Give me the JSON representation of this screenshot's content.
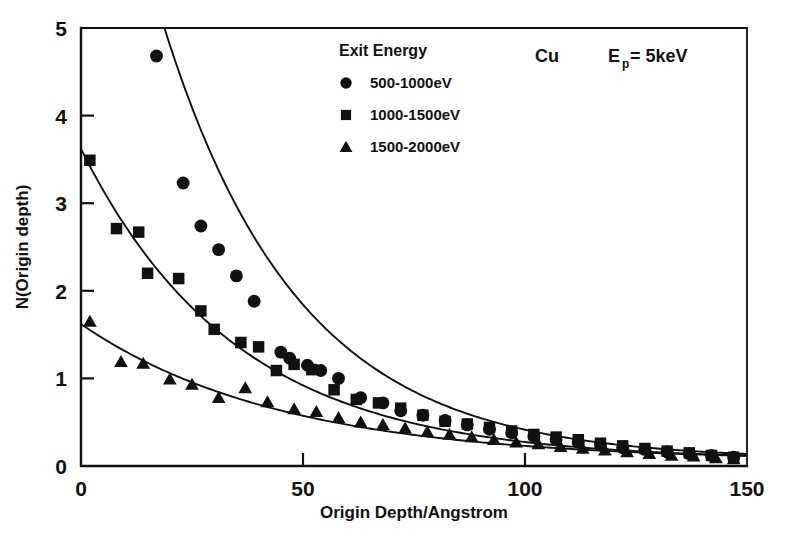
{
  "chart_data": {
    "type": "scatter",
    "title": "",
    "xlabel": "Origin Depth/Angstrom",
    "ylabel": "N(Origin depth)",
    "xlim": [
      0,
      150
    ],
    "ylim": [
      0,
      5
    ],
    "xticks": [
      0,
      50,
      100,
      150
    ],
    "yticks": [
      0,
      1,
      2,
      3,
      4,
      5
    ],
    "grid": false,
    "legend_position": "top-center",
    "legend_title": "Exit Energy",
    "annotations": [
      {
        "text": "Cu",
        "position": "top-right"
      },
      {
        "text": "E",
        "sub": "p",
        "text2": "= 5keV",
        "position": "top-right"
      }
    ],
    "series": [
      {
        "name": "500-1000eV",
        "marker": "circle",
        "points": [
          [
            17,
            4.68
          ],
          [
            23,
            3.23
          ],
          [
            27,
            2.74
          ],
          [
            31,
            2.47
          ],
          [
            35,
            2.17
          ],
          [
            39,
            1.88
          ],
          [
            45,
            1.3
          ],
          [
            47,
            1.23
          ],
          [
            51,
            1.15
          ],
          [
            54,
            1.09
          ],
          [
            58,
            1.0
          ],
          [
            63,
            0.78
          ],
          [
            68,
            0.72
          ],
          [
            72,
            0.63
          ],
          [
            77,
            0.58
          ],
          [
            82,
            0.52
          ],
          [
            87,
            0.47
          ],
          [
            92,
            0.42
          ],
          [
            97,
            0.38
          ],
          [
            102,
            0.34
          ],
          [
            107,
            0.3
          ],
          [
            112,
            0.27
          ],
          [
            117,
            0.24
          ],
          [
            122,
            0.21
          ],
          [
            127,
            0.19
          ],
          [
            132,
            0.16
          ],
          [
            137,
            0.14
          ],
          [
            142,
            0.12
          ],
          [
            147,
            0.1
          ]
        ],
        "fit": {
          "form": "exponential_decay",
          "y0": 9.2,
          "decay_length": 30.5,
          "offset": 0.07
        }
      },
      {
        "name": "1000-1500eV",
        "marker": "square",
        "points": [
          [
            2,
            3.49
          ],
          [
            8,
            2.71
          ],
          [
            13,
            2.67
          ],
          [
            15,
            2.2
          ],
          [
            22,
            2.14
          ],
          [
            27,
            1.77
          ],
          [
            30,
            1.56
          ],
          [
            36,
            1.41
          ],
          [
            40,
            1.36
          ],
          [
            44,
            1.09
          ],
          [
            48,
            1.16
          ],
          [
            52,
            1.1
          ],
          [
            57,
            0.87
          ],
          [
            62,
            0.76
          ],
          [
            67,
            0.72
          ],
          [
            72,
            0.66
          ],
          [
            77,
            0.58
          ],
          [
            82,
            0.51
          ],
          [
            87,
            0.48
          ],
          [
            92,
            0.44
          ],
          [
            97,
            0.4
          ],
          [
            102,
            0.36
          ],
          [
            107,
            0.33
          ],
          [
            112,
            0.3
          ],
          [
            117,
            0.26
          ],
          [
            122,
            0.23
          ],
          [
            127,
            0.2
          ],
          [
            132,
            0.17
          ],
          [
            137,
            0.15
          ],
          [
            142,
            0.12
          ],
          [
            147,
            0.1
          ]
        ],
        "fit": {
          "form": "exponential_decay",
          "y0": 3.62,
          "decay_length": 35.0,
          "offset": 0.07
        }
      },
      {
        "name": "1500-2000eV",
        "marker": "triangle",
        "points": [
          [
            2,
            1.65
          ],
          [
            9,
            1.19
          ],
          [
            14,
            1.17
          ],
          [
            20,
            0.99
          ],
          [
            25,
            0.93
          ],
          [
            31,
            0.78
          ],
          [
            37,
            0.89
          ],
          [
            42,
            0.73
          ],
          [
            48,
            0.65
          ],
          [
            53,
            0.62
          ],
          [
            58,
            0.55
          ],
          [
            63,
            0.5
          ],
          [
            68,
            0.47
          ],
          [
            73,
            0.43
          ],
          [
            78,
            0.39
          ],
          [
            83,
            0.36
          ],
          [
            88,
            0.33
          ],
          [
            93,
            0.3
          ],
          [
            98,
            0.27
          ],
          [
            103,
            0.25
          ],
          [
            108,
            0.22
          ],
          [
            113,
            0.2
          ],
          [
            118,
            0.18
          ],
          [
            123,
            0.16
          ],
          [
            128,
            0.14
          ],
          [
            133,
            0.12
          ],
          [
            138,
            0.11
          ],
          [
            143,
            0.09
          ],
          [
            147,
            0.08
          ]
        ],
        "fit": {
          "form": "exponential_decay",
          "y0": 1.62,
          "decay_length": 45.0,
          "offset": 0.06
        }
      }
    ]
  },
  "legend": {
    "title": "Exit Energy",
    "entries": [
      {
        "marker": "circle",
        "label": "500-1000eV"
      },
      {
        "marker": "square",
        "label": "1000-1500eV"
      },
      {
        "marker": "triangle",
        "label": "1500-2000eV"
      }
    ]
  },
  "annotation": {
    "material": "Cu",
    "energy_symbol": "E",
    "energy_subscript": "p",
    "energy_value": "= 5keV"
  },
  "axes": {
    "x_title": "Origin Depth/Angstrom",
    "y_title": "N(Origin depth)",
    "x_tick_labels": [
      "0",
      "50",
      "100",
      "150"
    ],
    "y_tick_labels": [
      "0",
      "1",
      "2",
      "3",
      "4",
      "5"
    ]
  },
  "colors": {
    "ink": "#111111",
    "background": "#ffffff"
  }
}
